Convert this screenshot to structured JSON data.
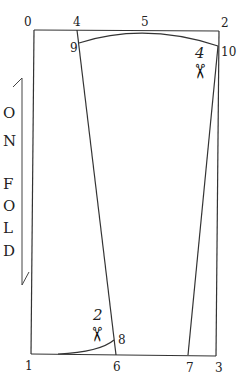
{
  "diagram": {
    "type": "sewing pattern draft",
    "points": [
      {
        "id": "0",
        "label": "0"
      },
      {
        "id": "4",
        "label": "4"
      },
      {
        "id": "5",
        "label": "5"
      },
      {
        "id": "2",
        "label": "2"
      },
      {
        "id": "9",
        "label": "9"
      },
      {
        "id": "10",
        "label": "10"
      },
      {
        "id": "1",
        "label": "1"
      },
      {
        "id": "6",
        "label": "6"
      },
      {
        "id": "7",
        "label": "7"
      },
      {
        "id": "3",
        "label": "3"
      },
      {
        "id": "8",
        "label": "8"
      }
    ],
    "fold_label": {
      "letters": [
        "O",
        "N",
        "F",
        "O",
        "L",
        "D"
      ],
      "text": "ON FOLD"
    },
    "scissors_marks": [
      {
        "number": "4",
        "icon": "scissors-icon",
        "glyph": "✂"
      },
      {
        "number": "2",
        "icon": "scissors-icon",
        "glyph": "✂"
      }
    ],
    "colors": {
      "line": "#333333",
      "text": "#222222",
      "background": "#ffffff"
    }
  }
}
